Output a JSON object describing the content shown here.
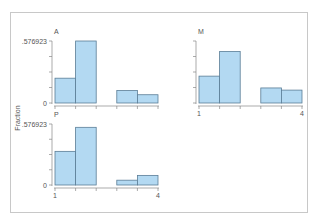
{
  "chart_data": {
    "type": "bar",
    "subtype": "histogram-by-group",
    "ylabel": "Fraction",
    "xlabel": "",
    "xlim": [
      1,
      4
    ],
    "ylim": [
      0,
      0.576923
    ],
    "x_tick_labels": [
      "1",
      "4"
    ],
    "y_tick_labels": [
      "0",
      ".576923"
    ],
    "bins": [
      "1-1.6",
      "1.6-2.2",
      "2.2-2.8",
      "2.8-3.4",
      "3.4-4"
    ],
    "bin_edges": [
      1,
      1.6,
      2.2,
      2.8,
      3.4,
      4.0
    ],
    "grid": false,
    "legend": null,
    "series": [
      {
        "name": "A",
        "values": [
          0.2308,
          0.5769,
          0,
          0.1154,
          0.0769
        ]
      },
      {
        "name": "M",
        "values": [
          0.25,
          0.48,
          0,
          0.14,
          0.12
        ]
      },
      {
        "name": "P",
        "values": [
          0.3182,
          0.5455,
          0,
          0.0455,
          0.0909
        ]
      }
    ],
    "colors": {
      "fill": "#b3d9f2",
      "stroke": "#5a7d96",
      "axis": "#888888"
    }
  },
  "labels": {
    "ylabel": "Fraction",
    "ytop": ".576923",
    "yzero": "0",
    "xmin": "1",
    "xmax": "4",
    "panelA": "A",
    "panelM": "M",
    "panelP": "P"
  }
}
